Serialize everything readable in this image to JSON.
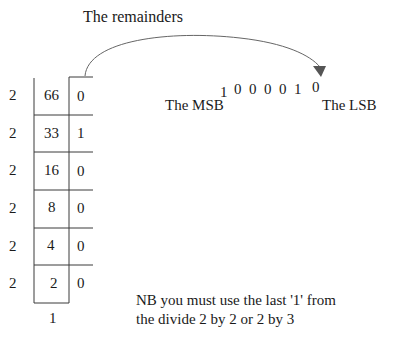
{
  "title": "The remainders",
  "divisor": "2",
  "rows": [
    {
      "divisor": "2",
      "quotient": "66",
      "remainder": "0"
    },
    {
      "divisor": "2",
      "quotient": "33",
      "remainder": "1"
    },
    {
      "divisor": "2",
      "quotient": "16",
      "remainder": "0"
    },
    {
      "divisor": "2",
      "quotient": "8",
      "remainder": "0"
    },
    {
      "divisor": "2",
      "quotient": "4",
      "remainder": "0"
    },
    {
      "divisor": "2",
      "quotient": "2",
      "remainder": "0"
    }
  ],
  "final_quotient": "1",
  "binary_result": {
    "bits": [
      "1",
      "0",
      "0",
      "0",
      "0",
      "1",
      "0"
    ],
    "msb_label": "The MSB",
    "lsb_label": "The LSB"
  },
  "note": {
    "line1": "NB you must use the last '1' from",
    "line2": "the divide 2 by 2 or 2 by 3"
  },
  "colors": {
    "text": "#1a1a1a",
    "line": "#3a3a3a",
    "arrow": "#555555"
  }
}
